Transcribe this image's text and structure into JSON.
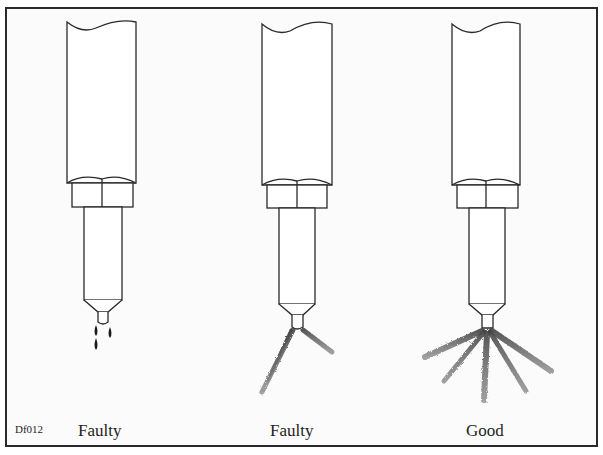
{
  "figure": {
    "code": "Df012",
    "injectors": [
      {
        "id": "injector-1",
        "condition": "Faulty",
        "spray_pattern": "dripping"
      },
      {
        "id": "injector-2",
        "condition": "Faulty",
        "spray_pattern": "uneven-two-stream"
      },
      {
        "id": "injector-3",
        "condition": "Good",
        "spray_pattern": "even-fan-five-stream"
      }
    ]
  },
  "colors": {
    "line": "#2a2a2a",
    "spray": "#555555",
    "background": "#fbfbfb"
  }
}
